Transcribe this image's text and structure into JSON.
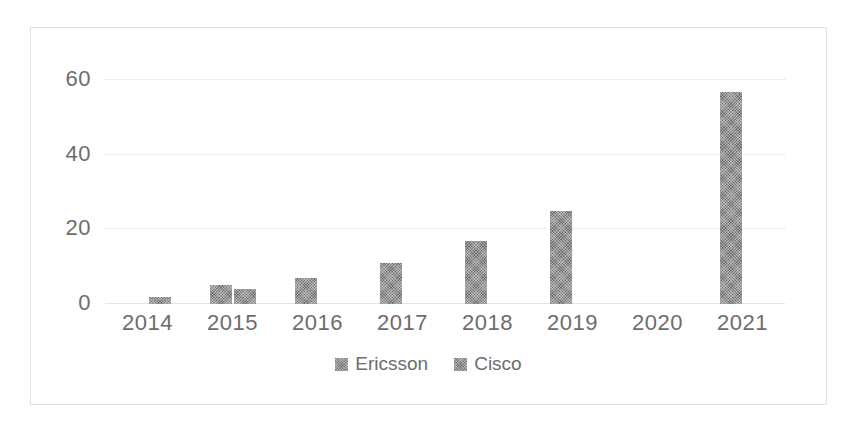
{
  "chart_data": {
    "type": "bar",
    "title": "",
    "subtitle": "",
    "xlabel": "",
    "ylabel": "",
    "categories": [
      "2014",
      "2015",
      "2016",
      "2017",
      "2018",
      "2019",
      "2020",
      "2021"
    ],
    "series": [
      {
        "name": "Ericsson",
        "color": "#6e6e6e",
        "values": [
          0,
          5,
          7,
          11,
          17,
          25,
          0,
          57
        ]
      },
      {
        "name": "Cisco",
        "color": "#6e6e6e",
        "values": [
          2,
          4,
          0,
          0,
          0,
          0,
          0,
          0
        ]
      }
    ],
    "ylim": [
      0,
      66
    ],
    "yticks": [
      0,
      20,
      40,
      60
    ],
    "ytick_labels": [
      "0",
      "20",
      "40",
      "60"
    ],
    "grid": true,
    "legend_position": "bottom",
    "legend_entries": [
      "Ericsson",
      "Cisco"
    ],
    "annotations": []
  },
  "axes": {
    "y_tick_labels": [
      "60",
      "40",
      "20",
      "0"
    ],
    "x_tick_labels": [
      "2014",
      "2015",
      "2016",
      "2017",
      "2018",
      "2019",
      "2020",
      "2021"
    ]
  },
  "legend": {
    "items": [
      {
        "label": "Ericsson",
        "swatch": "legend-swatch-ericsson"
      },
      {
        "label": "Cisco",
        "swatch": "legend-swatch-cisco"
      }
    ]
  },
  "style": {
    "bar_color": "#6e6e6e",
    "grid_color": "#dededc",
    "axis_text_color": "#6d6d6d",
    "frame_border_color": "#e2e2e2",
    "background": "#ffffff"
  }
}
